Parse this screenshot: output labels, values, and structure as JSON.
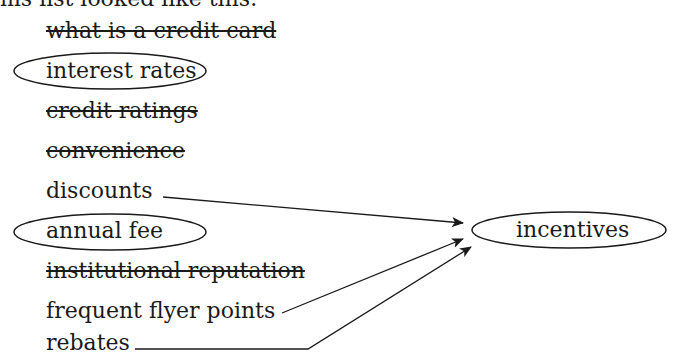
{
  "intro_text": "ms list looked like this:",
  "items": [
    {
      "label": "what is a credit card",
      "state": "struck"
    },
    {
      "label": "interest rates",
      "state": "circled"
    },
    {
      "label": "credit ratings",
      "state": "struck"
    },
    {
      "label": "convenience",
      "state": "struck"
    },
    {
      "label": "discounts",
      "state": "arrow"
    },
    {
      "label": "annual fee",
      "state": "circled"
    },
    {
      "label": "institutional reputation",
      "state": "struck"
    },
    {
      "label": "frequent flyer points",
      "state": "arrow"
    },
    {
      "label": "rebates",
      "state": "arrow"
    }
  ],
  "group": {
    "label": "incentives",
    "members": [
      "discounts",
      "frequent flyer points",
      "rebates"
    ]
  },
  "colors": {
    "ink": "#1a1a1a",
    "background": "#ffffff"
  }
}
